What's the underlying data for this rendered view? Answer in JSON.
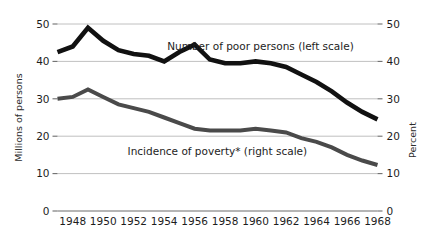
{
  "chart_data": {
    "type": "line",
    "title": "",
    "xlabel": "",
    "ylabel": "Millions of persons",
    "y2label": "Percent",
    "xlim": [
      1947,
      1968
    ],
    "ylim": [
      0,
      50
    ],
    "y2lim": [
      0,
      50
    ],
    "grid": true,
    "legend_position": "inline-annotations",
    "x_ticks": [
      "1948",
      "1950",
      "1952",
      "1954",
      "1956",
      "1958",
      "1960",
      "1962",
      "1964",
      "1966",
      "1968"
    ],
    "x_tick_values": [
      1948,
      1950,
      1952,
      1954,
      1956,
      1958,
      1960,
      1962,
      1964,
      1966,
      1968
    ],
    "y_ticks_left": [
      "0",
      "10",
      "20",
      "30",
      "40",
      "50"
    ],
    "y_tick_values_left": [
      0,
      10,
      20,
      30,
      40,
      50
    ],
    "y_ticks_right": [
      "0",
      "10",
      "20",
      "30",
      "40",
      "50"
    ],
    "y_tick_values_right": [
      0,
      10,
      20,
      30,
      40,
      50
    ],
    "x": [
      1947,
      1948,
      1949,
      1950,
      1951,
      1952,
      1953,
      1954,
      1955,
      1956,
      1957,
      1958,
      1959,
      1960,
      1961,
      1962,
      1963,
      1964,
      1965,
      1966,
      1967,
      1968
    ],
    "series": [
      {
        "name": "Number of poor persons (left scale)",
        "axis": "left",
        "color": "#111111",
        "units": "millions of persons",
        "values": [
          42.5,
          44.0,
          49.0,
          45.5,
          43.0,
          42.0,
          41.5,
          40.0,
          42.5,
          44.5,
          40.5,
          39.5,
          39.5,
          40.0,
          39.5,
          38.5,
          36.5,
          34.5,
          32.0,
          29.0,
          26.5,
          24.5
        ]
      },
      {
        "name": "Incidence of poverty* (right scale)",
        "axis": "right",
        "color": "#4a4a4a",
        "units": "percent",
        "values": [
          30.0,
          30.5,
          32.5,
          30.5,
          28.5,
          27.5,
          26.5,
          25.0,
          23.5,
          22.0,
          21.5,
          21.5,
          21.5,
          22.0,
          21.5,
          21.0,
          19.5,
          18.5,
          17.0,
          15.0,
          13.5,
          12.3
        ]
      }
    ],
    "annotations": [
      {
        "name": "series-label-number-of-poor",
        "text": "Number of poor persons (left scale)",
        "x": 1954.2,
        "y": 44.0,
        "anchor": "start"
      },
      {
        "name": "series-label-incidence-of-poverty",
        "text": "Incidence of poverty* (right scale)",
        "x": 1951.6,
        "y": 16.0,
        "anchor": "start"
      }
    ]
  }
}
